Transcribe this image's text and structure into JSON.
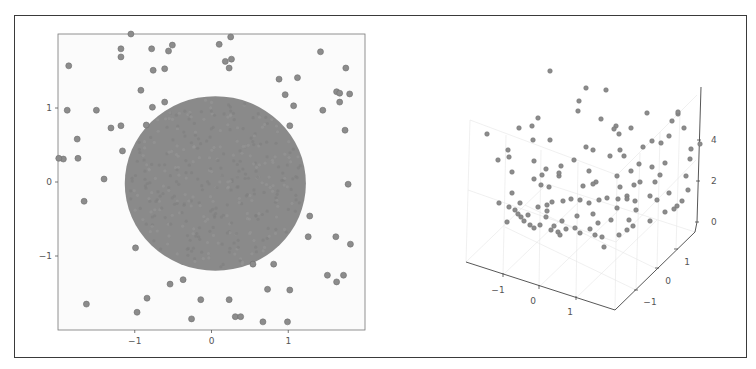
{
  "figure": {
    "background": "#ffffff",
    "frame_color": "#3a3a3a",
    "point_color": "#8c8c8c",
    "point_edge": "#6e6e6e",
    "circle_color": "#8a8a8a"
  },
  "chart_data": [
    {
      "type": "scatter",
      "title": "",
      "xlabel": "",
      "ylabel": "",
      "xlim": [
        -2,
        2
      ],
      "ylim": [
        -2,
        2
      ],
      "grid": false,
      "xticks": [
        -1,
        0,
        1
      ],
      "yticks": [
        -1,
        0,
        1
      ],
      "xtick_labels": [
        "−1",
        "0",
        "1"
      ],
      "ytick_labels": [
        "−1",
        "0",
        "1"
      ],
      "annotations": [],
      "region": {
        "shape": "circle",
        "center": [
          0.05,
          -0.02
        ],
        "radius": 1.18,
        "note": "densely filled disk of points"
      },
      "series": [
        {
          "name": "outer points",
          "x": [
            -1.05,
            -1.18,
            -1.18,
            -1.86,
            -0.78,
            -0.56,
            -0.51,
            -0.76,
            -0.61,
            0.1,
            0.25,
            0.18,
            0.26,
            0.23,
            1.42,
            1.75,
            0.88,
            1.12,
            0.96,
            1.63,
            1.67,
            1.8,
            1.67,
            1.07,
            -1.88,
            -1.5,
            -0.92,
            -0.77,
            -0.61,
            -1.93,
            -1.31,
            -1.18,
            -0.85,
            1.02,
            1.45,
            1.74,
            -1.75,
            -1.74,
            -1.99,
            -1.16,
            -1.4,
            -1.66,
            1.78,
            1.28,
            1.26,
            1.62,
            1.81,
            -0.99,
            0.54,
            0.81,
            1.51,
            1.72,
            1.63,
            1.02,
            -0.37,
            -0.54,
            -0.84,
            -0.14,
            0.23,
            -1.63,
            -0.97,
            -0.26,
            0.31,
            0.38,
            0.67,
            0.99,
            0.73
          ],
          "y": [
            2.0,
            1.8,
            1.69,
            1.57,
            1.8,
            1.77,
            1.85,
            1.51,
            1.53,
            1.86,
            1.96,
            1.63,
            1.66,
            1.54,
            1.76,
            1.54,
            1.39,
            1.41,
            1.18,
            1.22,
            1.2,
            1.19,
            1.08,
            1.03,
            0.97,
            0.97,
            1.24,
            1.01,
            1.08,
            0.31,
            0.73,
            0.76,
            0.77,
            0.76,
            0.97,
            0.7,
            0.58,
            0.32,
            0.32,
            0.42,
            0.04,
            -0.26,
            -0.03,
            -0.46,
            -0.74,
            -0.74,
            -0.84,
            -0.89,
            -1.11,
            -1.11,
            -1.26,
            -1.26,
            -1.35,
            -1.46,
            -1.32,
            -1.38,
            -1.57,
            -1.59,
            -1.59,
            -1.65,
            -1.76,
            -1.85,
            -1.82,
            -1.82,
            -1.89,
            -1.89,
            -1.45
          ]
        }
      ]
    },
    {
      "type": "scatter",
      "projection": "3d",
      "title": "",
      "xlabel": "",
      "ylabel": "",
      "zlabel": "",
      "xlim": [
        -1.8,
        1.8
      ],
      "ylim": [
        -1.8,
        1.8
      ],
      "zlim": [
        0,
        6
      ],
      "grid": true,
      "xticks": [
        -1,
        0,
        1
      ],
      "yticks": [
        -1,
        0,
        1
      ],
      "zticks": [
        0,
        2,
        4
      ],
      "xtick_labels": [
        "−1",
        "0",
        "1"
      ],
      "ytick_labels": [
        "−1",
        "0",
        "1"
      ],
      "ztick_labels": [
        "0",
        "2",
        "4"
      ],
      "note": "points lie on paraboloid-like surface z ≈ x² + y² (bowl shape)",
      "screen_points": [
        [
          550,
          71
        ],
        [
          586,
          88
        ],
        [
          579,
          101
        ],
        [
          606,
          90
        ],
        [
          578,
          111
        ],
        [
          538,
          118
        ],
        [
          532,
          126
        ],
        [
          601,
          119
        ],
        [
          616,
          126
        ],
        [
          647,
          113
        ],
        [
          678,
          114
        ],
        [
          631,
          128
        ],
        [
          619,
          134
        ],
        [
          614,
          129
        ],
        [
          487,
          134
        ],
        [
          519,
          128
        ],
        [
          533,
          140
        ],
        [
          550,
          140
        ],
        [
          586,
          147
        ],
        [
          593,
          150
        ],
        [
          620,
          150
        ],
        [
          508,
          150
        ],
        [
          534,
          161
        ],
        [
          574,
          160
        ],
        [
          610,
          156
        ],
        [
          624,
          156
        ],
        [
          643,
          147
        ],
        [
          639,
          164
        ],
        [
          652,
          141
        ],
        [
          661,
          143
        ],
        [
          669,
          136
        ],
        [
          672,
          121
        ],
        [
          678,
          112
        ],
        [
          561,
          166
        ],
        [
          559,
          176
        ],
        [
          549,
          187
        ],
        [
          552,
          202
        ],
        [
          547,
          211
        ],
        [
          589,
          171
        ],
        [
          596,
          182
        ],
        [
          617,
          176
        ],
        [
          620,
          187
        ],
        [
          631,
          171
        ],
        [
          634,
          185
        ],
        [
          640,
          182
        ],
        [
          512,
          172
        ],
        [
          534,
          179
        ],
        [
          559,
          173
        ],
        [
          546,
          169
        ],
        [
          583,
          186
        ],
        [
          593,
          184
        ],
        [
          498,
          160
        ],
        [
          509,
          157
        ],
        [
          542,
          175
        ],
        [
          541,
          185
        ],
        [
          512,
          193
        ],
        [
          520,
          203
        ],
        [
          538,
          207
        ],
        [
          547,
          205
        ],
        [
          563,
          201
        ],
        [
          571,
          199
        ],
        [
          580,
          200
        ],
        [
          589,
          203
        ],
        [
          599,
          200
        ],
        [
          607,
          198
        ],
        [
          618,
          199
        ],
        [
          627,
          196
        ],
        [
          546,
          217
        ],
        [
          562,
          221
        ],
        [
          577,
          216
        ],
        [
          593,
          214
        ],
        [
          598,
          223
        ],
        [
          611,
          220
        ],
        [
          617,
          208
        ],
        [
          627,
          199
        ],
        [
          635,
          201
        ],
        [
          650,
          196
        ],
        [
          657,
          200
        ],
        [
          499,
          203
        ],
        [
          509,
          207
        ],
        [
          515,
          210
        ],
        [
          521,
          217
        ],
        [
          524,
          221
        ],
        [
          530,
          225
        ],
        [
          534,
          228
        ],
        [
          540,
          225
        ],
        [
          551,
          230
        ],
        [
          554,
          226
        ],
        [
          558,
          232
        ],
        [
          560,
          235
        ],
        [
          566,
          229
        ],
        [
          575,
          228
        ],
        [
          580,
          233
        ],
        [
          590,
          229
        ],
        [
          595,
          235
        ],
        [
          602,
          237
        ],
        [
          604,
          247
        ],
        [
          619,
          235
        ],
        [
          627,
          230
        ],
        [
          633,
          226
        ],
        [
          507,
          222
        ],
        [
          518,
          214
        ],
        [
          528,
          215
        ],
        [
          636,
          210
        ],
        [
          629,
          220
        ],
        [
          650,
          221
        ],
        [
          665,
          212
        ],
        [
          677,
          206
        ],
        [
          682,
          201
        ],
        [
          688,
          190
        ],
        [
          686,
          176
        ],
        [
          669,
          193
        ],
        [
          674,
          209
        ],
        [
          660,
          175
        ],
        [
          665,
          163
        ],
        [
          652,
          167
        ],
        [
          655,
          182
        ],
        [
          690,
          159
        ],
        [
          700,
          144
        ],
        [
          691,
          149
        ],
        [
          684,
          128
        ]
      ]
    }
  ]
}
